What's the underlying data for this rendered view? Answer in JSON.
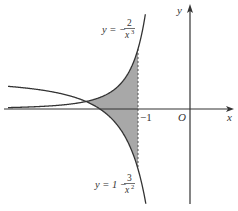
{
  "figure": {
    "type": "function-plot",
    "axes": {
      "x_label": "x",
      "y_label": "y",
      "origin_label": "O",
      "x_tick_label": "−1",
      "x_tick_value": -1
    },
    "curves": [
      {
        "name": "cubic-reciprocal",
        "label_lhs": "y = −",
        "label_num": "2",
        "label_den": "x",
        "label_exp": "3",
        "expression": "y = -2/x^3"
      },
      {
        "name": "quadratic-reciprocal",
        "label_lhs": "y = 1 −",
        "label_num": "3",
        "label_den": "x",
        "label_exp": "2",
        "expression": "y = 1 - 3/x^2"
      }
    ],
    "shaded_region": {
      "description": "Region between the two curves",
      "x_from": -2,
      "x_to": -1,
      "fill": "#a8a8a8"
    },
    "intersection": {
      "x": -2,
      "y": 0.25
    },
    "colors": {
      "curve": "#333333",
      "axis": "#333333",
      "shade": "#a8a8a8"
    }
  }
}
